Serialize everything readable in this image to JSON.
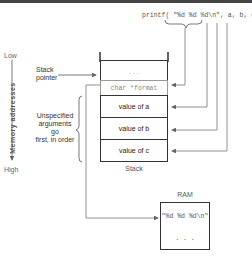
{
  "call": {
    "text": "printf( \"%d %d %d\\n\", a, b, c )"
  },
  "axis": {
    "low": "Low",
    "high": "High",
    "label": "Memory addresses"
  },
  "stack_pointer": {
    "label_line1": "Stack",
    "label_line2": "pointer"
  },
  "note": {
    "line1": "Unspecified",
    "line2": "arguments go",
    "line3": "first, in order"
  },
  "stack": {
    "title": "Stack",
    "cells": [
      {
        "text": ". . ."
      },
      {
        "text": "char *format"
      },
      {
        "text": "value of a"
      },
      {
        "text": "value of b"
      },
      {
        "text": "value of c"
      }
    ]
  },
  "ram": {
    "title": "RAM",
    "cells": [
      {
        "text": "\"%d %d %d\\n\""
      },
      {
        "text": ". . ."
      }
    ]
  },
  "colors": {
    "line": "#555555",
    "border": "#333333",
    "topbar": "#444444"
  }
}
